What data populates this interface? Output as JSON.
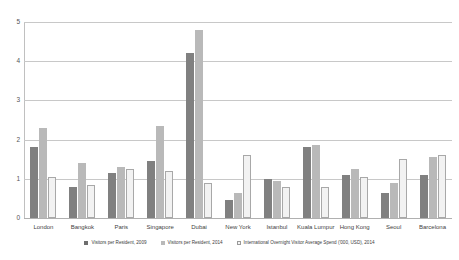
{
  "chart_data": {
    "type": "bar",
    "title": "",
    "xlabel": "",
    "ylabel": "",
    "ylim": [
      0,
      5
    ],
    "yticks": [
      "0",
      "1",
      "2",
      "3",
      "4",
      "5"
    ],
    "grid": true,
    "legend_position": "bottom",
    "categories": [
      "London",
      "Bangkok",
      "Paris",
      "Singapore",
      "Dubai",
      "New York",
      "Istanbul",
      "Kuala Lumpur",
      "Hong Kong",
      "Seoul",
      "Barcelona"
    ],
    "series": [
      {
        "name": "Visitors per Resident, 2009",
        "color": "#808080",
        "values": [
          1.8,
          0.8,
          1.15,
          1.45,
          4.2,
          0.45,
          1.0,
          1.8,
          1.1,
          0.65,
          1.1
        ]
      },
      {
        "name": "Visitors per Resident, 2014",
        "color": "#b9b9b9",
        "values": [
          2.3,
          1.4,
          1.3,
          2.35,
          4.8,
          0.65,
          0.95,
          1.85,
          1.25,
          0.9,
          1.55
        ]
      },
      {
        "name": "International Overnight Visitor Average Spend ('000, USD), 2014",
        "color": "#f2f2f2",
        "values": [
          1.05,
          0.85,
          1.25,
          1.2,
          0.9,
          1.6,
          0.8,
          0.8,
          1.05,
          1.5,
          1.6
        ]
      }
    ]
  }
}
